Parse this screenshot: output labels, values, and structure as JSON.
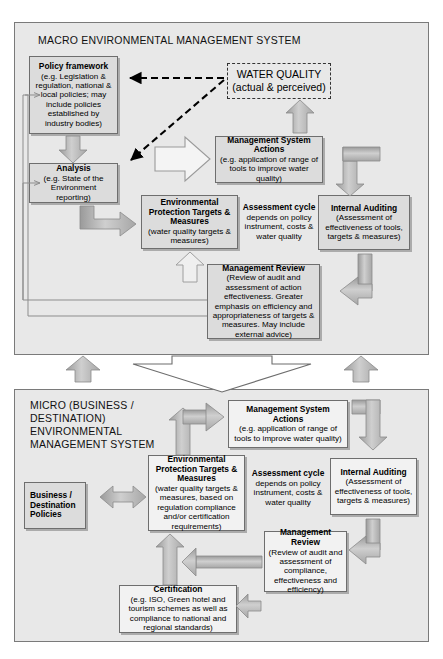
{
  "macro": {
    "title": "MACRO ENVIRONMENTAL MANAGEMENT SYSTEM",
    "policy_framework": {
      "heading": "Policy framework",
      "body": "(e.g. Legislation & regulation, national & local policies; may include policies established by industry bodies)"
    },
    "analysis": {
      "heading": "Analysis",
      "body": "(e.g. State of the Environment reporting)"
    },
    "water_quality": {
      "line1": "WATER QUALITY",
      "line2": "(actual & perceived)"
    },
    "management_system_actions": {
      "heading": "Management System Actions",
      "body": "(e.g. application of range of tools to improve water quality)"
    },
    "environmental_protection_targets": {
      "heading": "Environmental Protection Targets & Measures",
      "body": "(water quality targets & measures)"
    },
    "assessment_cycle": {
      "heading": "Assessment cycle",
      "body": "depends on policy instrument, costs & water quality"
    },
    "internal_auditing": {
      "heading": "Internal Auditing",
      "body": "(Assessment of effectiveness of tools, targets & measures)"
    },
    "management_review": {
      "heading": "Management Review",
      "body": "(Review of audit and assessment of action effectiveness. Greater emphasis on efficiency and appropriateness of targets & measures. May include external advice)"
    }
  },
  "micro": {
    "title": "MICRO (BUSINESS / DESTINATION) ENVIRONMENTAL MANAGEMENT SYSTEM",
    "business_destination_policies": {
      "heading": "Business / Destination Policies"
    },
    "management_system_actions": {
      "heading": "Management System Actions",
      "body": "(e.g. application of range of tools to improve water quality)"
    },
    "environmental_protection_targets": {
      "heading": "Environmental Protection Targets & Measures",
      "body": "(water quality targets & measures, based on regulation compliance and/or certification requirements)"
    },
    "assessment_cycle": {
      "heading": "Assessment cycle",
      "body": "depends on policy instrument, costs & water quality"
    },
    "internal_auditing": {
      "heading": "Internal Auditing",
      "body": "(Assessment of effectiveness of tools, targets & measures)"
    },
    "management_review": {
      "heading": "Management Review",
      "body": "(Review of audit and assessment of compliance, effectiveness and efficiency)"
    },
    "certification": {
      "heading": "Certification",
      "body": "(e.g. ISO, Green hotel  and tourism schemes as well as compliance to national and regional standards)"
    }
  },
  "colors": {
    "panel_fill": "#e8e8e8",
    "panel_border": "#7a7a7a",
    "box_fill": "#dcdcdc",
    "box_border": "#6e6e6e",
    "arrow_fill": "#b4b4b4",
    "arrow_stroke": "#8a8a8a",
    "dashed_arrow": "#000000"
  }
}
